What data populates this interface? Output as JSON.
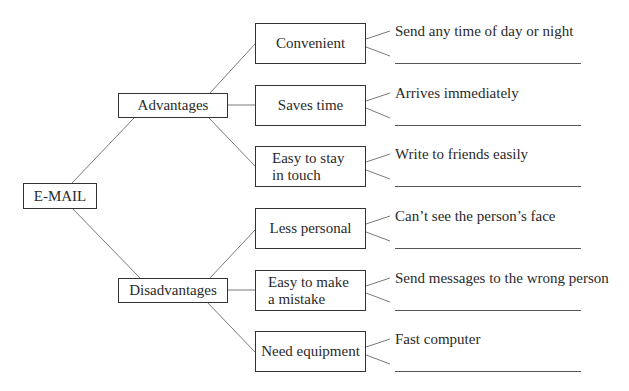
{
  "root": {
    "label": "E-MAIL"
  },
  "branches": [
    {
      "label": "Advantages",
      "items": [
        {
          "label": "Convenient",
          "example": "Send any time of day or night",
          "blank": ""
        },
        {
          "label": "Saves time",
          "example": "Arrives immediately",
          "blank": ""
        },
        {
          "label": "Easy to stay in touch",
          "line1": "Easy to stay",
          "line2": "in touch",
          "example": "Write to friends easily",
          "blank": ""
        }
      ]
    },
    {
      "label": "Disadvantages",
      "items": [
        {
          "label": "Less personal",
          "example": "Can’t see the person’s face",
          "blank": ""
        },
        {
          "label": "Easy to make a mistake",
          "line1": "Easy to make",
          "line2": "a mistake",
          "example": "Send messages to the wrong person",
          "blank": ""
        },
        {
          "label": "Need equipment",
          "example": "Fast computer",
          "blank": ""
        }
      ]
    }
  ],
  "colors": {
    "line": "#7a7a7a",
    "border": "#333333",
    "text": "#2a2a2a"
  }
}
